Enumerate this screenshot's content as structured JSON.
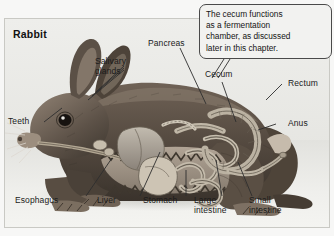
{
  "figure": {
    "title": "Rabbit",
    "callout": {
      "text": "The cecum functions\nas a fermentation\nchamber, as discussed\nlater in this chapter."
    },
    "labels": [
      {
        "name": "pancreas",
        "text": "Pancreas"
      },
      {
        "name": "salivary-glands",
        "text": "Salivary\nglands"
      },
      {
        "name": "cecum",
        "text": "Cecum"
      },
      {
        "name": "rectum",
        "text": "Rectum"
      },
      {
        "name": "anus",
        "text": "Anus"
      },
      {
        "name": "teeth",
        "text": "Teeth"
      },
      {
        "name": "esophagus",
        "text": "Esophagus"
      },
      {
        "name": "liver",
        "text": "Liver"
      },
      {
        "name": "stomach",
        "text": "Stomach"
      },
      {
        "name": "large-intestine",
        "text": "Large\nintestine"
      },
      {
        "name": "small-intestine",
        "text": "Small\nintestine"
      }
    ],
    "colors": {
      "background": "#f7f7f6",
      "panel": "#e9e9e6",
      "frame": "#c9c9c4",
      "text": "#1b1b1b",
      "leader": "#3a3a3a",
      "fur_dark": "#4a4138",
      "fur_mid": "#7d7065",
      "fur_light": "#b4a89a",
      "organ": "#9a9186"
    }
  }
}
